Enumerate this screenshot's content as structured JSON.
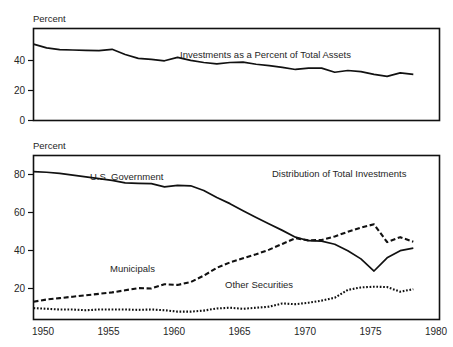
{
  "figure": {
    "background": "#ffffff",
    "ink": "#111111"
  },
  "panels": {
    "top": {
      "axis_label": "Percent",
      "title": "Investments as a Percent of Total Assets",
      "yticks": [
        "0",
        "20",
        "40"
      ]
    },
    "bottom": {
      "axis_label": "Percent",
      "title": "Distribution of Total Investments",
      "yticks": [
        "20",
        "40",
        "60",
        "80"
      ],
      "xticks": [
        "1950",
        "1955",
        "1960",
        "1965",
        "1970",
        "1975",
        "1980"
      ],
      "series_labels": {
        "government": "U.S. Government",
        "municipals": "Municipals",
        "other": "Other Securities"
      }
    }
  },
  "chart_data": [
    {
      "type": "line",
      "title": "Investments as a Percent of Total Assets",
      "xlabel": "",
      "ylabel": "Percent",
      "xlim": [
        1949,
        1980
      ],
      "ylim": [
        0,
        53
      ],
      "yticks": [
        0,
        20,
        40
      ],
      "xticks": [
        1950,
        1955,
        1960,
        1965,
        1970,
        1975,
        1980
      ],
      "grid": false,
      "legend": "none",
      "series": [
        {
          "name": "Investments as a Percent of Total Assets",
          "style": "solid",
          "x": [
            1949,
            1950,
            1951,
            1952,
            1953,
            1954,
            1955,
            1956,
            1957,
            1958,
            1959,
            1960,
            1961,
            1962,
            1963,
            1964,
            1965,
            1966,
            1967,
            1968,
            1969,
            1970,
            1971,
            1972,
            1973,
            1974,
            1975,
            1976,
            1977,
            1978
          ],
          "values": [
            44.0,
            41.8,
            40.8,
            40.6,
            40.4,
            40.2,
            41.0,
            38.0,
            35.8,
            35.2,
            34.4,
            36.4,
            34.6,
            33.4,
            32.6,
            33.4,
            33.6,
            32.4,
            31.6,
            30.6,
            29.4,
            30.2,
            30.2,
            27.8,
            28.8,
            28.2,
            26.6,
            25.4,
            27.4,
            26.6
          ]
        }
      ]
    },
    {
      "type": "line",
      "title": "Distribution of Total Investments",
      "xlabel": "",
      "ylabel": "Percent",
      "xlim": [
        1949,
        1980
      ],
      "ylim": [
        0,
        92
      ],
      "yticks": [
        20,
        40,
        60,
        80
      ],
      "xticks": [
        1950,
        1955,
        1960,
        1965,
        1970,
        1975,
        1980
      ],
      "grid": false,
      "legend": "inline-annotations",
      "series": [
        {
          "name": "U.S. Government",
          "style": "solid",
          "x": [
            1949,
            1950,
            1951,
            1952,
            1953,
            1954,
            1955,
            1956,
            1957,
            1958,
            1959,
            1960,
            1961,
            1962,
            1963,
            1964,
            1965,
            1966,
            1967,
            1968,
            1969,
            1970,
            1971,
            1972,
            1973,
            1974,
            1975,
            1976,
            1977,
            1978
          ],
          "values": [
            83.0,
            82.6,
            82.0,
            81.0,
            80.0,
            79.0,
            78.0,
            76.6,
            76.4,
            76.2,
            74.4,
            75.2,
            75.0,
            72.4,
            68.4,
            65.0,
            61.0,
            57.2,
            53.6,
            50.0,
            46.2,
            44.2,
            44.0,
            42.2,
            38.6,
            34.0,
            27.2,
            34.6,
            38.6,
            40.0
          ]
        },
        {
          "name": "Municipals",
          "style": "dashed",
          "x": [
            1949,
            1950,
            1951,
            1952,
            1953,
            1954,
            1955,
            1956,
            1957,
            1958,
            1959,
            1960,
            1961,
            1962,
            1963,
            1964,
            1965,
            1966,
            1967,
            1968,
            1969,
            1970,
            1971,
            1972,
            1973,
            1974,
            1975,
            1976,
            1977,
            1978
          ],
          "values": [
            10.0,
            11.2,
            12.0,
            12.8,
            13.6,
            14.4,
            15.2,
            16.4,
            17.6,
            17.4,
            19.8,
            19.4,
            21.0,
            24.6,
            29.0,
            32.0,
            34.4,
            36.6,
            39.2,
            42.4,
            45.6,
            44.4,
            44.6,
            46.6,
            49.2,
            51.6,
            53.4,
            43.4,
            46.2,
            43.6
          ]
        },
        {
          "name": "Other Securities",
          "style": "dotted",
          "x": [
            1949,
            1950,
            1951,
            1952,
            1953,
            1954,
            1955,
            1956,
            1957,
            1958,
            1959,
            1960,
            1961,
            1962,
            1963,
            1964,
            1965,
            1966,
            1967,
            1968,
            1969,
            1970,
            1971,
            1972,
            1973,
            1974,
            1975,
            1976,
            1977,
            1978
          ],
          "values": [
            6.4,
            6.0,
            5.6,
            5.6,
            5.2,
            5.6,
            5.6,
            5.6,
            5.4,
            5.6,
            5.2,
            4.4,
            4.4,
            5.0,
            6.2,
            6.6,
            6.0,
            6.6,
            7.2,
            9.0,
            8.6,
            9.4,
            10.6,
            12.2,
            16.6,
            18.0,
            18.4,
            18.2,
            15.6,
            17.0
          ]
        }
      ]
    }
  ]
}
